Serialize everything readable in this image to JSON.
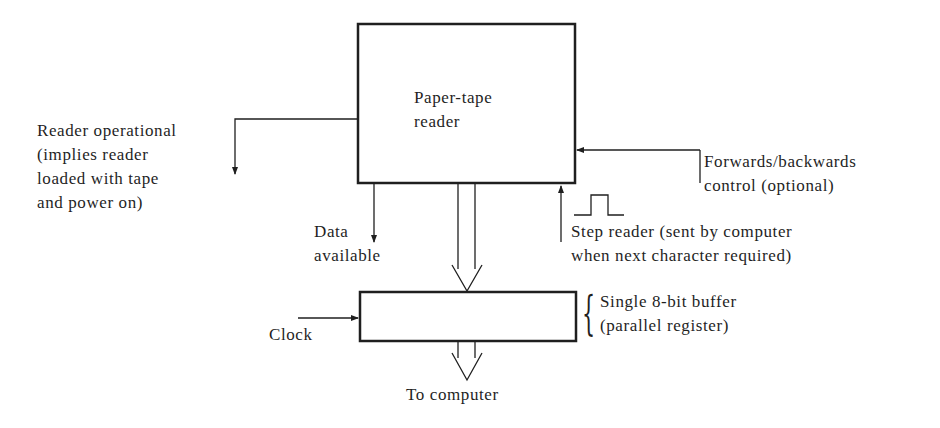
{
  "diagram": {
    "blocks": {
      "reader": {
        "lines": [
          "Paper-tape",
          "reader"
        ]
      },
      "buffer": {
        "note_lines": [
          "Single 8-bit buffer",
          "(parallel register)"
        ]
      }
    },
    "signals": {
      "reader_operational": {
        "lines": [
          "Reader operational",
          "(implies reader",
          "loaded with tape",
          "and power on)"
        ],
        "direction": "out"
      },
      "forwards_backwards": {
        "lines": [
          "Forwards/backwards",
          "control (optional)"
        ],
        "direction": "in"
      },
      "data_available": {
        "lines": [
          "Data",
          "available"
        ],
        "direction": "out"
      },
      "step_reader": {
        "lines": [
          "Step reader (sent by computer",
          "when  next character required)"
        ],
        "direction": "in"
      },
      "clock": {
        "label": "Clock",
        "direction": "in"
      },
      "to_computer": {
        "label": "To computer",
        "direction": "out"
      }
    },
    "colors": {
      "ink": "#1f1f1f",
      "background": "#ffffff"
    }
  }
}
